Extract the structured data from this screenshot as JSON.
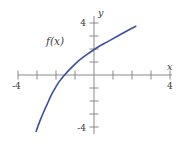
{
  "chart_data": {
    "type": "line",
    "title": "",
    "xlabel": "x",
    "ylabel": "y",
    "grid": false,
    "legend": "none",
    "xlim": [
      -4.8,
      4.8
    ],
    "ylim": [
      -5.0,
      5.0
    ],
    "xticks": [
      -4,
      -3,
      -2,
      -1,
      1,
      2,
      3,
      4
    ],
    "yticks": [
      -4,
      -3,
      -2,
      -1,
      1,
      2,
      3,
      4
    ],
    "xtick_labels_shown": [
      "-4",
      "4"
    ],
    "ytick_labels_shown": [
      "4",
      "-4"
    ],
    "series": [
      {
        "name": "f(x)",
        "color": "#3d4fa0",
        "x": [
          -3.05,
          -2.85,
          -2.65,
          -2.45,
          -2.3,
          -2.1,
          -1.85,
          -1.55,
          -1.2,
          -0.8,
          -0.35,
          0.15,
          0.7,
          1.25,
          1.75,
          2.2
        ],
        "y": [
          -4.35,
          -3.55,
          -2.85,
          -2.2,
          -1.7,
          -1.15,
          -0.55,
          0.0,
          0.55,
          1.1,
          1.6,
          2.1,
          2.55,
          3.0,
          3.4,
          3.75
        ]
      }
    ]
  },
  "labels": {
    "x_axis": "x",
    "y_axis": "y",
    "x_neg_four": "-4",
    "x_pos_four": "4",
    "y_pos_four": "4",
    "y_neg_four": "-4",
    "function_label": "f(x)"
  },
  "colors": {
    "curve": "#3d4fa0",
    "axis": "#8a8a8a",
    "text": "#3a3a3a",
    "background": "#ffffff"
  },
  "geometry": {
    "origin_x": 94,
    "origin_y": 75,
    "unit_x": 19,
    "unit_y": 13
  }
}
